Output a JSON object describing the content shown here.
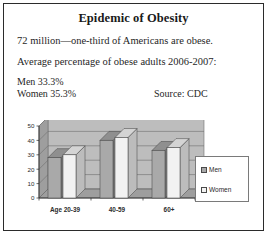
{
  "poster": {
    "title": "Epidemic of Obesity",
    "line1": "72 million—one-third of Americans are obese.",
    "line2": "Average percentage of obese adults 2006-2007:",
    "stat_men": "Men 33.3%",
    "stat_women": "Women 35.3%",
    "source": "Source: CDC"
  },
  "legend": {
    "men_label": "Men",
    "women_label": "Women",
    "men_color": "#a9a9a9",
    "women_color": "#f2f2f2"
  },
  "chart_data": {
    "type": "bar",
    "title": "",
    "xlabel": "",
    "ylabel": "",
    "categories": [
      "Age 20-39",
      "40-59",
      "60+"
    ],
    "series": [
      {
        "name": "Men",
        "values": [
          28,
          40,
          33
        ],
        "color": "#a9a9a9"
      },
      {
        "name": "Women",
        "values": [
          30,
          42,
          35
        ],
        "color": "#f2f2f2"
      }
    ],
    "ylim": [
      0,
      50
    ],
    "yticks": [
      0,
      10,
      20,
      30,
      40,
      50
    ],
    "ytick_labels": [
      "0",
      "10",
      "20",
      "30",
      "40",
      "50"
    ],
    "grid": true,
    "legend_position": "right",
    "style": "3d-clustered-column",
    "plot_bg": "#bdbdbd"
  }
}
